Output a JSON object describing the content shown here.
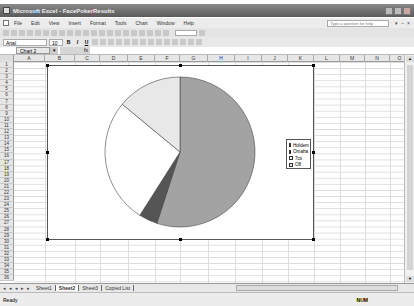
{
  "window": {
    "title": "Microsoft Excel - FacePokerResults"
  },
  "menu": [
    "File",
    "Edit",
    "View",
    "Insert",
    "Format",
    "Tools",
    "Chart",
    "Window",
    "Help"
  ],
  "help_box": {
    "placeholder": "Type a question for help"
  },
  "format_bar": {
    "font": "Arial",
    "size": "10",
    "bold": "B",
    "italic": "I",
    "underline": "U"
  },
  "formula_bar": {
    "name_box": "Chart 2",
    "fx": "fx"
  },
  "columns": [
    "A",
    "B",
    "C",
    "D",
    "E",
    "F",
    "G",
    "H",
    "I",
    "J",
    "K",
    "L",
    "M",
    "N",
    "O"
  ],
  "rows": [
    "1",
    "2",
    "3",
    "4",
    "5",
    "6",
    "7",
    "8",
    "9",
    "10",
    "11",
    "12",
    "13",
    "14",
    "15",
    "16",
    "17",
    "18",
    "19",
    "20",
    "21",
    "22",
    "23",
    "24",
    "25",
    "26",
    "27",
    "28",
    "29",
    "30",
    "31",
    "32",
    "33",
    "34",
    "35",
    "36"
  ],
  "sheet_tabs": [
    "Sheet1",
    "Sheet2",
    "Sheet3",
    "Copied List"
  ],
  "active_sheet": "Sheet2",
  "status": {
    "left": "Ready",
    "num": "NUM"
  },
  "chart_data": {
    "type": "pie",
    "title": "",
    "categories": [
      "Holdem",
      "Omaha",
      "7cs",
      "O8"
    ],
    "values": [
      55,
      4,
      27,
      14
    ],
    "colors": [
      "#a3a3a3",
      "#555555",
      "#ffffff",
      "#e8e8e8"
    ],
    "legend_position": "right"
  }
}
